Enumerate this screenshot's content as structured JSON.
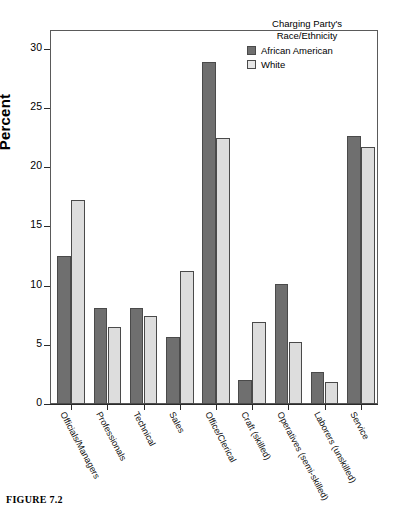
{
  "caption": "FIGURE 7.2",
  "legend": {
    "title_line1": "Charging Party's",
    "title_line2": "Race/Ethnicity",
    "entries": [
      {
        "label": "African American",
        "color": "#6f6f6f"
      },
      {
        "label": "White",
        "color": "#e6e6e6"
      }
    ]
  },
  "chart_data": {
    "type": "bar",
    "title": "",
    "xlabel": "",
    "ylabel": "Percent",
    "ylim": [
      0,
      31.5
    ],
    "yticks": [
      0,
      5,
      10,
      15,
      20,
      25,
      30
    ],
    "ytick_labels": [
      "0",
      "5",
      "10",
      "15",
      "20",
      "25",
      "30"
    ],
    "grid": false,
    "legend_position": "top-right",
    "categories": [
      "Officials/Managers",
      "Professionals",
      "Technical",
      "Sales",
      "Office/Clerical",
      "Craft (skilled)",
      "Operatives (semi-skilled)",
      "Laborers (unskilled)",
      "Service"
    ],
    "series": [
      {
        "name": "African American",
        "color": "#6f6f6f",
        "values": [
          12.5,
          8.1,
          8.1,
          5.7,
          28.9,
          2.0,
          10.1,
          2.7,
          22.6
        ]
      },
      {
        "name": "White",
        "color": "#dddddd",
        "values": [
          17.2,
          6.5,
          7.4,
          11.2,
          22.5,
          6.9,
          5.2,
          1.9,
          21.7
        ]
      }
    ]
  }
}
